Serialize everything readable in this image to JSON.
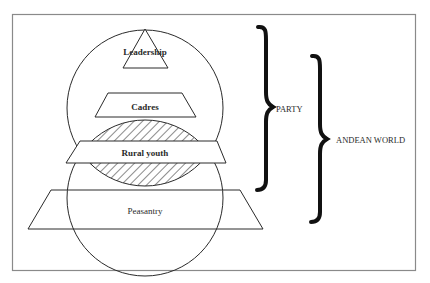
{
  "diagram": {
    "type": "nested-hierarchy",
    "tiers": [
      {
        "id": "leadership",
        "label": "Leadership",
        "shape": "triangle"
      },
      {
        "id": "cadres",
        "label": "Cadres",
        "shape": "trapezoid"
      },
      {
        "id": "rural-youth",
        "label": "Rural youth",
        "shape": "trapezoid"
      },
      {
        "id": "peasantry",
        "label": "Peasantry",
        "shape": "trapezoid"
      }
    ],
    "groups": [
      {
        "id": "party",
        "label": "PARTY",
        "spans": [
          "leadership",
          "cadres",
          "rural-youth"
        ]
      },
      {
        "id": "andean-world",
        "label": "ANDEAN WORLD",
        "spans": [
          "rural-youth",
          "peasantry"
        ]
      }
    ],
    "overlap": {
      "description": "hatched intersection of upper (party) and lower (Andean world) circles"
    }
  },
  "colors": {
    "stroke": "#2a2a2a",
    "frame": "#8a8a8a",
    "brace": "#111111",
    "background": "#ffffff"
  }
}
